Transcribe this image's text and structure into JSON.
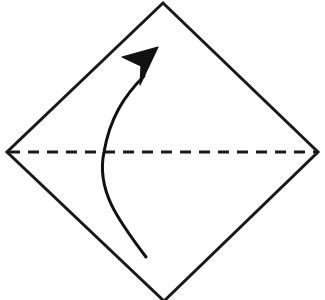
{
  "figure": {
    "type": "origami-fold-diagram",
    "canvas": {
      "width": 325,
      "height": 300,
      "background": "#ffffff"
    },
    "colors": {
      "stroke": "#1a1a1a",
      "fill": "#ffffff",
      "arrow": "#111111"
    }
  },
  "paper": {
    "name": "square-sheet-rotated-45",
    "shape": "square",
    "orientation_deg": 45,
    "stroke_width": 3,
    "vertices": [
      {
        "label": "top",
        "x": 163,
        "y": 3
      },
      {
        "label": "right",
        "x": 318,
        "y": 152
      },
      {
        "label": "bottom",
        "x": 164,
        "y": 301
      },
      {
        "label": "left",
        "x": 7,
        "y": 152
      }
    ],
    "points_attr": "163,3 318,152 164,301 7,152"
  },
  "fold_line": {
    "name": "valley-fold-crease",
    "style": "dashed",
    "dash_pattern": "11 8",
    "stroke_width": 3,
    "x1": 9,
    "y1": 152,
    "x2": 316,
    "y2": 152
  },
  "fold_arrow": {
    "name": "fold-direction-arrow",
    "description": "curved arrow sweeping from lower area upward to the upper-right",
    "direction": "up",
    "stroke_width": 3,
    "curve_path": "M 146 257 C 118 220 96 190 104 152 C 110 118 124 96 144 76",
    "start": {
      "x": 146,
      "y": 257
    },
    "crosses_crease_at": {
      "x": 104,
      "y": 152
    },
    "tip": {
      "x": 158,
      "y": 47
    },
    "head_path": "M 158 47 L 122 57 L 141 66 L 140 85 Z"
  },
  "labels": {
    "caption": "",
    "step_number": ""
  }
}
